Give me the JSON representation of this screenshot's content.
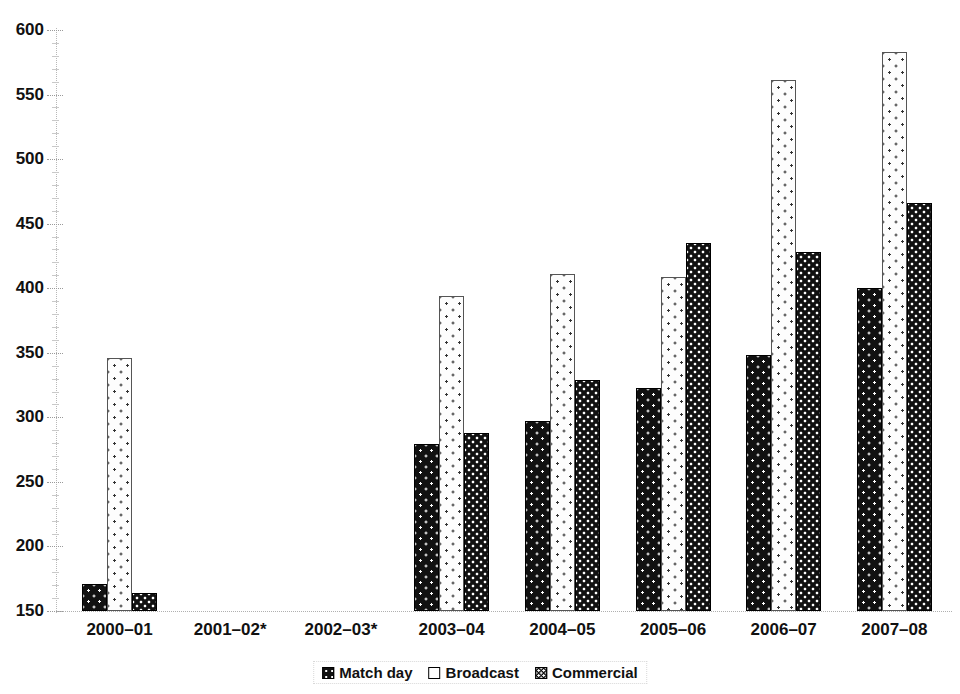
{
  "chart_data": {
    "type": "bar",
    "title": "",
    "subtitle": "",
    "xlabel": "",
    "ylabel": "",
    "ylim": [
      150,
      600
    ],
    "ytick_values": [
      150,
      200,
      250,
      300,
      350,
      400,
      450,
      500,
      550,
      600
    ],
    "ytick_labels": [
      "150",
      "200",
      "250",
      "300",
      "350",
      "400",
      "450",
      "500",
      "550",
      "600"
    ],
    "grid": false,
    "legend_position": "bottom",
    "categories": [
      "2000–01",
      "2001–02*",
      "2002–03*",
      "2003–04",
      "2004–05",
      "2005–06",
      "2006–07",
      "2007–08"
    ],
    "series": [
      {
        "name": "Match day",
        "pattern": "black-sparse-dots",
        "values": [
          171,
          null,
          null,
          279,
          297,
          323,
          348,
          400
        ]
      },
      {
        "name": "Broadcast",
        "pattern": "white-dotted",
        "values": [
          346,
          null,
          null,
          394,
          411,
          409,
          561,
          583
        ]
      },
      {
        "name": "Commercial",
        "pattern": "black-dense-dots",
        "values": [
          164,
          null,
          null,
          288,
          329,
          435,
          428,
          466
        ]
      }
    ],
    "notes": [
      "2001–02 and 2002–03 have no data"
    ]
  },
  "legend": {
    "items": [
      {
        "label": "Match day",
        "swatch": "matchday-swatch-icon"
      },
      {
        "label": "Broadcast",
        "swatch": "broadcast-swatch-icon"
      },
      {
        "label": "Commercial",
        "swatch": "commercial-swatch-icon"
      }
    ]
  },
  "colors": {
    "matchday": "#111111",
    "broadcast": "#fdfdfd",
    "commercial": "#111111",
    "axis": "#b0b0b0",
    "text": "#111111",
    "background": "#ffffff"
  }
}
